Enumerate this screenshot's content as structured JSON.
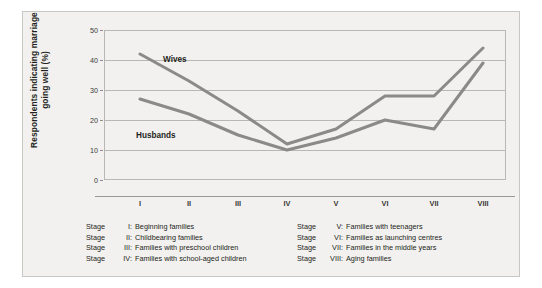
{
  "chart_data": {
    "type": "line",
    "title": "",
    "xlabel": "",
    "ylabel": "Respondents indicating marriage going well (%)",
    "ylabel_line1": "Respondents indicating marriage",
    "ylabel_line2": "going well (%)",
    "categories": [
      "I",
      "II",
      "III",
      "IV",
      "V",
      "VI",
      "VII",
      "VIII"
    ],
    "ylim": [
      0,
      50
    ],
    "yticks": [
      0,
      10,
      20,
      30,
      40,
      50
    ],
    "ytick_labels": [
      "0",
      "10",
      "20",
      "30",
      "40",
      "50"
    ],
    "grid": true,
    "legend_position": "inline-annotation",
    "series": [
      {
        "name": "Wives",
        "color": "#8a8a88",
        "values": [
          42,
          33,
          23,
          12,
          17,
          28,
          28,
          44
        ]
      },
      {
        "name": "Husbands",
        "color": "#8a8a88",
        "values": [
          27,
          22,
          15,
          10,
          14,
          20,
          17,
          39
        ]
      }
    ]
  },
  "annotations": {
    "wives_label": "Wives",
    "husbands_label": "Husbands"
  },
  "legend": {
    "left_column": [
      {
        "stage": "Stage",
        "numeral": "I:",
        "text": "Beginning families"
      },
      {
        "stage": "Stage",
        "numeral": "II:",
        "text": "Childbearing families"
      },
      {
        "stage": "Stage",
        "numeral": "III:",
        "text": "Families with preschool children"
      },
      {
        "stage": "Stage",
        "numeral": "IV:",
        "text": "Families with school-aged children"
      }
    ],
    "right_column": [
      {
        "stage": "Stage",
        "numeral": "V:",
        "text": "Families with teenagers"
      },
      {
        "stage": "Stage",
        "numeral": "VI:",
        "text": "Families as launching centres"
      },
      {
        "stage": "Stage",
        "numeral": "VII:",
        "text": "Families in the middle years"
      },
      {
        "stage": "Stage",
        "numeral": "VIII:",
        "text": "Aging families"
      }
    ]
  },
  "colors": {
    "panel_background": "#f2f1ef",
    "grid": "#b9b7b3",
    "line": "#8a8a88",
    "text": "#231f20"
  }
}
